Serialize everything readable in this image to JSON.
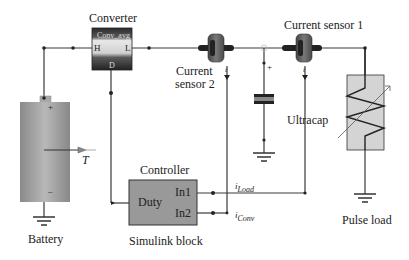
{
  "labels": {
    "converter": "Converter",
    "converter_block": "Conv_avg",
    "converter_port_h": "H",
    "converter_port_l": "L",
    "converter_port_d": "D",
    "current_sensor_1": "Current sensor 1",
    "current_sensor_2_line1": "Current",
    "current_sensor_2_line2": "sensor 2",
    "ultracap": "Ultracap",
    "battery": "Battery",
    "battery_temp": "T",
    "battery_plus": "+",
    "battery_minus": "–",
    "ultracap_plus": "+",
    "controller": "Controller",
    "controller_duty": "Duty",
    "controller_in1": "In1",
    "controller_in2": "In2",
    "simulink_block": "Simulink block",
    "i_load": "i",
    "i_load_sub": "Load",
    "i_conv": "i",
    "i_conv_sub": "Conv",
    "pulse_load": "Pulse load",
    "sensor_i_1": "i",
    "sensor_i_2": "i"
  },
  "colors": {
    "wire": "#3a3a3a",
    "block_dark": "#2e2e2e",
    "block_mid": "#8a8a8a",
    "controller_fill": "#999999",
    "battery_fill": "#9b9b9b",
    "load_fill": "#d4d4d4",
    "sensor": "#6d6f6c"
  }
}
